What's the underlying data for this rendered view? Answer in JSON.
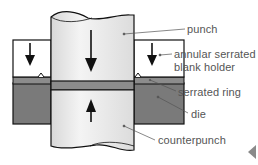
{
  "diagram": {
    "labels": {
      "punch": "punch",
      "blank_holder_line1": "annular serrated",
      "blank_holder_line2": "blank holder",
      "serrated_ring": "serrated ring",
      "die": "die",
      "counterpunch": "counterpunch"
    },
    "arrows": {
      "punch": "down",
      "blank_holder_left": "down",
      "blank_holder_right": "down",
      "counterpunch": "up"
    },
    "colors": {
      "background": "#ffffff",
      "outline": "#111111",
      "die": "#7a7a7a",
      "strip": "#8c8c8c",
      "punch_fill": "#e6e6e6",
      "label_text": "#555555"
    }
  },
  "navigation": {
    "previous_icon": "triangle-left-icon"
  }
}
